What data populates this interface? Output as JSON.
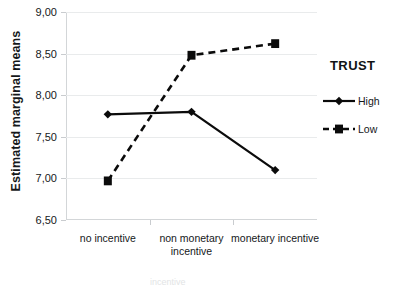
{
  "chart_data": {
    "type": "line",
    "title": "",
    "xlabel": "",
    "ylabel": "Estimated marginal means",
    "categories": [
      "no incentive",
      "non monetary incentive",
      "monetary incentive"
    ],
    "category_lines": [
      [
        "no incentive"
      ],
      [
        "non monetary",
        "incentive"
      ],
      [
        "monetary incentive"
      ]
    ],
    "series": [
      {
        "name": "High",
        "values": [
          7.77,
          7.8,
          7.1
        ],
        "line_style": "solid",
        "marker": "diamond",
        "color": "#0b0b0b"
      },
      {
        "name": "Low",
        "values": [
          6.97,
          8.48,
          8.62
        ],
        "line_style": "dashed",
        "marker": "square",
        "color": "#0b0b0b"
      }
    ],
    "ylim": [
      6.5,
      9.0
    ],
    "ytick_values": [
      9.0,
      8.5,
      8.0,
      7.5,
      7.0,
      6.5
    ],
    "ytick_labels": [
      "9,00",
      "8,50",
      "8,00",
      "7,50",
      "7,00",
      "6,50"
    ],
    "grid": true,
    "legend_position": "right",
    "legend_title": "TRUST",
    "decimal_separator": ","
  },
  "legend": {
    "title": "TRUST",
    "entries": [
      {
        "label": "High",
        "style": "solid",
        "marker": "diamond"
      },
      {
        "label": "Low",
        "style": "dashed",
        "marker": "square"
      }
    ]
  },
  "axes": {
    "y_title": "Estimated marginal means"
  },
  "artifact": {
    "bottom_text": "incentive"
  }
}
